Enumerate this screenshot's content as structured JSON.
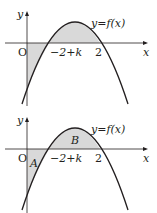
{
  "figure": {
    "panels": [
      {
        "id": "top",
        "axis_labels": {
          "x": "x",
          "y": "y",
          "origin": "O"
        },
        "curve_label": "y=f(x)",
        "tick_labels": {
          "left_root": "−2+k",
          "right_root": "2"
        },
        "shaded_regions": "between curve and x-axis from x=0 to x=2"
      },
      {
        "id": "bottom",
        "axis_labels": {
          "x": "x",
          "y": "y",
          "origin": "O"
        },
        "curve_label": "y=f(x)",
        "tick_labels": {
          "left_root": "−2+k",
          "right_root": "2"
        },
        "region_labels": {
          "A": "A",
          "B": "B"
        }
      }
    ],
    "colors": {
      "shade": "#d9d9d9",
      "curve": "#231f20",
      "axis": "#231f20"
    }
  }
}
